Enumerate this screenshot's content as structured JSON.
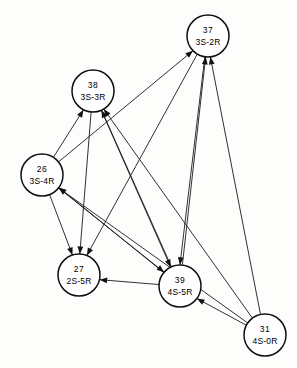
{
  "diagram": {
    "type": "directed-graph",
    "title": "",
    "width": 297,
    "height": 368,
    "background_color": "#fdfdfc",
    "node_fill_color": "#ffffff",
    "node_stroke_color": "#101010",
    "edge_color": "#1a1a1a",
    "node_radius": 21,
    "nodes": [
      {
        "key": "n37",
        "id": "37",
        "code": "3S-2R",
        "cx": 208,
        "cy": 36
      },
      {
        "key": "n38",
        "id": "38",
        "code": "3S-3R",
        "cx": 93,
        "cy": 91
      },
      {
        "key": "n26",
        "id": "26",
        "code": "3S-4R",
        "cx": 42,
        "cy": 175
      },
      {
        "key": "n27",
        "id": "27",
        "code": "2S-5R",
        "cx": 79,
        "cy": 275
      },
      {
        "key": "n39",
        "id": "39",
        "code": "4S-5R",
        "cx": 180,
        "cy": 286
      },
      {
        "key": "n31",
        "id": "31",
        "code": "4S-0R",
        "cx": 265,
        "cy": 335
      }
    ],
    "edges": [
      {
        "from": "n31",
        "to": "n37"
      },
      {
        "from": "n31",
        "to": "n38"
      },
      {
        "from": "n31",
        "to": "n26"
      },
      {
        "from": "n31",
        "to": "n39"
      },
      {
        "from": "n39",
        "to": "n37"
      },
      {
        "from": "n39",
        "to": "n38"
      },
      {
        "from": "n39",
        "to": "n26"
      },
      {
        "from": "n39",
        "to": "n27"
      },
      {
        "from": "n26",
        "to": "n38"
      },
      {
        "from": "n26",
        "to": "n37"
      },
      {
        "from": "n26",
        "to": "n27"
      },
      {
        "from": "n26",
        "to": "n39"
      },
      {
        "from": "n38",
        "to": "n27"
      },
      {
        "from": "n38",
        "to": "n39"
      },
      {
        "from": "n37",
        "to": "n27"
      },
      {
        "from": "n37",
        "to": "n39"
      }
    ]
  }
}
